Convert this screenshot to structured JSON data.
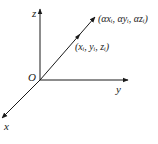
{
  "diagram": {
    "type": "3d-coordinate-axes",
    "origin_label": "O",
    "axes": [
      {
        "name": "z",
        "label": "z"
      },
      {
        "name": "y",
        "label": "y"
      },
      {
        "name": "x",
        "label": "x"
      }
    ],
    "points": [
      {
        "label": "(xᵢ, yᵢ, zᵢ)"
      },
      {
        "label": "(αxᵢ, αyᵢ, αzᵢ)"
      }
    ],
    "colors": {
      "ink": "#1a1a1a",
      "background": "#ffffff"
    }
  }
}
